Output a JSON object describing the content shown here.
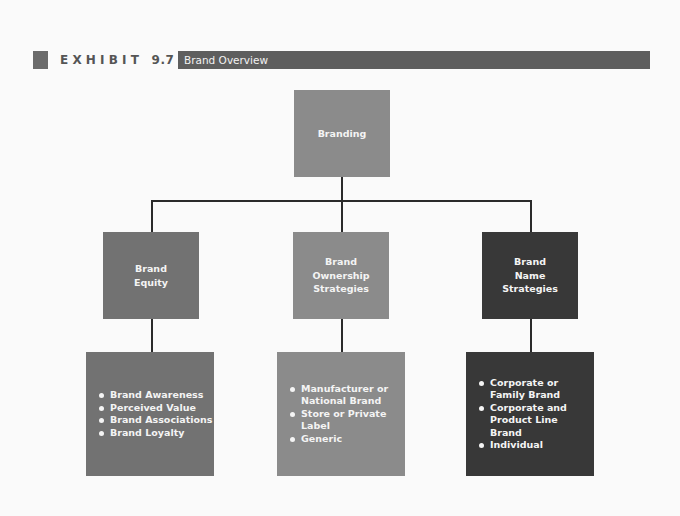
{
  "header": {
    "exhibit_label": "EXHIBIT",
    "exhibit_number": "9.7",
    "title": "Brand Overview"
  },
  "diagram": {
    "root": {
      "label": "Branding"
    },
    "children": [
      {
        "title_lines": [
          "Brand",
          "Equity"
        ],
        "items": [
          "Brand Awareness",
          "Perceived Value",
          "Brand Associations",
          "Brand Loyalty"
        ]
      },
      {
        "title_lines": [
          "Brand",
          "Ownership",
          "Strategies"
        ],
        "items": [
          "Manufacturer or National Brand",
          "Store or Private Label",
          "Generic"
        ]
      },
      {
        "title_lines": [
          "Brand",
          "Name",
          "Strategies"
        ],
        "items": [
          "Corporate or Family Brand",
          "Corporate and Product Line Brand",
          "Individual"
        ]
      }
    ]
  },
  "colors": {
    "root_fill": "#8b8b8b",
    "equity_fill": "#727272",
    "ownership_fill": "#8b8b8b",
    "name_fill": "#383838",
    "header_bar": "#5e5e5e",
    "connector": "#2a2a2a"
  }
}
